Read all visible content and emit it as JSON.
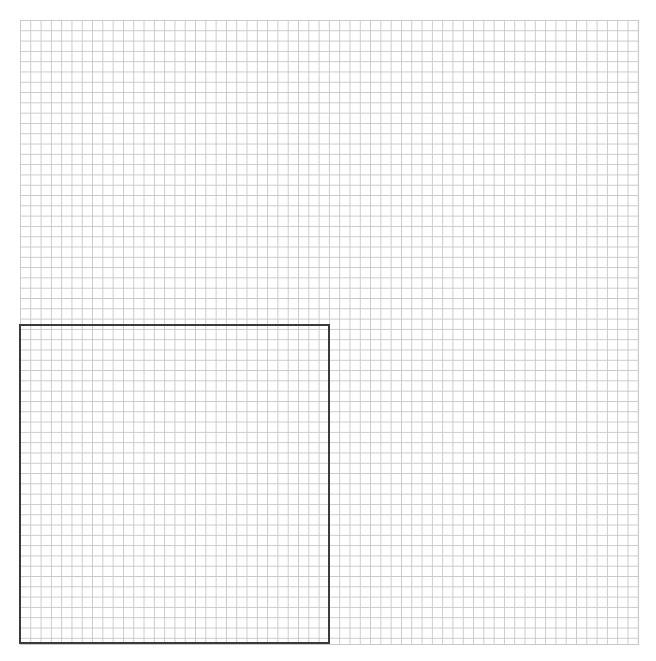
{
  "canvas": {
    "width": 656,
    "height": 661,
    "background_color": "#ffffff",
    "label": "Grid Canvas"
  },
  "grid": {
    "name": "graph-paper-grid",
    "origin_x": 20,
    "origin_y": 20,
    "width": 618,
    "height": 624,
    "cell_size": 10.3,
    "columns": 60,
    "rows": 61,
    "line_color": "#c9c9c9",
    "line_width": 1,
    "background_color": "#ffffff"
  },
  "selection": {
    "name": "selection-rectangle",
    "x": 19,
    "y": 324,
    "width": 311,
    "height": 320,
    "border_color": "#3a3a3a",
    "border_width": 2,
    "fill": "transparent",
    "columns_spanned": 30,
    "rows_spanned": 31
  },
  "chart_data": {
    "type": "scatter",
    "title": "",
    "subtitle": "",
    "xlabel": "",
    "ylabel": "",
    "grid": true,
    "legend": null,
    "xlim": [
      0,
      60
    ],
    "ylim": [
      0,
      61
    ],
    "x": [],
    "y": [],
    "annotations": [
      {
        "kind": "rectangle",
        "label": "selection-region",
        "x0": 0,
        "y0": 0,
        "x1": 30,
        "y1": 31,
        "stroke": "#3a3a3a",
        "fill": "none"
      }
    ]
  }
}
